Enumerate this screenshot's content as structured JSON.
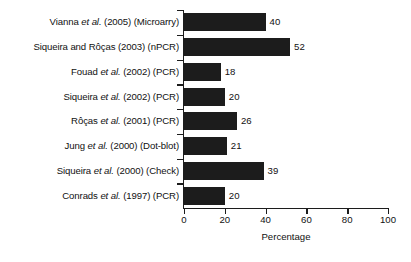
{
  "chart_data": {
    "type": "bar",
    "orientation": "horizontal",
    "title": "",
    "xlabel": "Percentage",
    "ylabel": "",
    "xlim": [
      0,
      100
    ],
    "xticks": [
      0,
      20,
      40,
      60,
      80,
      100
    ],
    "grid": false,
    "legend": null,
    "categories": [
      "Vianna et al. (2005) (Microarry)",
      "Siqueira and Rôças (2003) (nPCR)",
      "Fouad et al. (2002) (PCR)",
      "Siqueira et al. (2002) (PCR)",
      "Rôças et al. (2001) (PCR)",
      "Jung et al. (2000) (Dot-blot)",
      "Siqueira et al. (2000) (Check)",
      "Conrads et al. (1997) (PCR)"
    ],
    "values": [
      40,
      52,
      18,
      20,
      26,
      21,
      39,
      20
    ],
    "data_labels": [
      "40",
      "52",
      "18",
      "20",
      "26",
      "21",
      "39",
      "20"
    ],
    "bar_color": "#1c1c1c",
    "axis_color": "#1c1c1c",
    "background": "#ffffff",
    "rows": [
      {
        "author": "Vianna ",
        "italic": "et al.",
        "rest": " (2005) (Microarry)",
        "value": 40,
        "label": "40"
      },
      {
        "author": "Siqueira and Rôças (2003) (nPCR)",
        "italic": "",
        "rest": "",
        "value": 52,
        "label": "52"
      },
      {
        "author": "Fouad ",
        "italic": "et al.",
        "rest": " (2002) (PCR)",
        "value": 18,
        "label": "18"
      },
      {
        "author": "Siqueira ",
        "italic": "et al.",
        "rest": " (2002) (PCR)",
        "value": 20,
        "label": "20"
      },
      {
        "author": "Rôças ",
        "italic": "et al.",
        "rest": " (2001) (PCR)",
        "value": 26,
        "label": "26"
      },
      {
        "author": "Jung ",
        "italic": "et al.",
        "rest": " (2000) (Dot-blot)",
        "value": 21,
        "label": "21"
      },
      {
        "author": "Siqueira ",
        "italic": "et al.",
        "rest": " (2000) (Check)",
        "value": 39,
        "label": "39"
      },
      {
        "author": "Conrads ",
        "italic": "et al.",
        "rest": " (1997) (PCR)",
        "value": 20,
        "label": "20"
      }
    ]
  },
  "axis": {
    "x_title": "Percentage",
    "tick_labels": [
      "0",
      "20",
      "40",
      "60",
      "80",
      "100"
    ]
  }
}
